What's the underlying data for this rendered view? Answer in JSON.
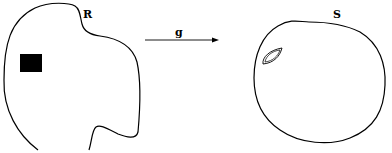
{
  "diagram": {
    "regions": [
      {
        "id": "R",
        "label": "R",
        "contains": "filled-rectangle"
      },
      {
        "id": "S",
        "label": "S",
        "contains": "lens-shape"
      }
    ],
    "map": {
      "label": "g",
      "from": "R",
      "to": "S"
    }
  },
  "colors": {
    "stroke": "#000000",
    "background": "#ffffff"
  }
}
